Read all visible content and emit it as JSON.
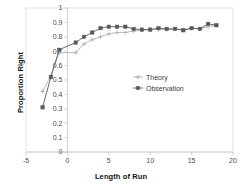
{
  "chart_data": {
    "type": "line",
    "title": "",
    "xlabel": "Length of Run",
    "ylabel": "Proportion Right",
    "xlim": [
      -5,
      20
    ],
    "ylim": [
      0,
      1
    ],
    "xticks": [
      "-5",
      "0",
      "5",
      "10",
      "15",
      "20"
    ],
    "xtick_values": [
      -5,
      0,
      5,
      10,
      15,
      20
    ],
    "yticks": [
      "0",
      "0.1",
      "0.2",
      "0.3",
      "0.4",
      "0.5",
      "0.6",
      "0.7",
      "0.8",
      "0.9",
      "1"
    ],
    "ytick_values": [
      0,
      0.1,
      0.2,
      0.3,
      0.4,
      0.5,
      0.6,
      0.7,
      0.8,
      0.9,
      1
    ],
    "grid": false,
    "legend_position": "center-right",
    "series": [
      {
        "name": "Theory",
        "color": "#b0b0b0",
        "marker": "cross",
        "x": [
          -3,
          -2,
          -1,
          1,
          2,
          3,
          4,
          5,
          6,
          7,
          8,
          9,
          10,
          11,
          12,
          13,
          14,
          15,
          16,
          17,
          18
        ],
        "values": [
          0.42,
          0.53,
          0.69,
          0.69,
          0.75,
          0.78,
          0.8,
          0.82,
          0.83,
          0.83,
          0.84,
          0.845,
          0.85,
          0.85,
          0.85,
          0.855,
          0.85,
          0.86,
          0.855,
          0.87,
          0.88
        ]
      },
      {
        "name": "Observation",
        "color": "#585858",
        "marker": "square",
        "x": [
          -3,
          -2,
          -1,
          1,
          2,
          3,
          4,
          5,
          6,
          7,
          8,
          9,
          10,
          11,
          12,
          13,
          14,
          15,
          16,
          17,
          18
        ],
        "values": [
          0.31,
          0.52,
          0.71,
          0.76,
          0.8,
          0.83,
          0.86,
          0.87,
          0.87,
          0.87,
          0.855,
          0.85,
          0.85,
          0.86,
          0.855,
          0.855,
          0.845,
          0.86,
          0.855,
          0.89,
          0.88
        ]
      }
    ]
  }
}
